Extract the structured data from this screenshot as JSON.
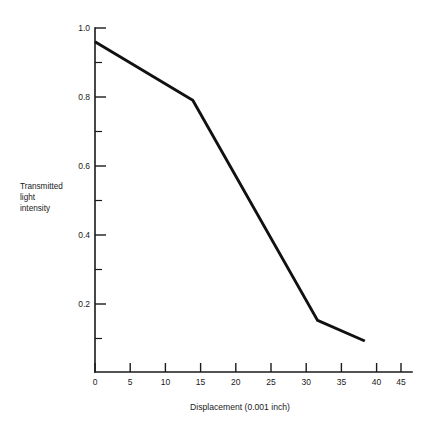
{
  "chart_data": {
    "type": "line",
    "title": "",
    "subtitle": "",
    "xlabel": "Displacement (0.001 inch)",
    "ylabel_lines": [
      "Transmitted",
      "light",
      "intensity"
    ],
    "ylabel": "Transmitted light intensity",
    "xlim": [
      0,
      47
    ],
    "ylim": [
      0,
      1.0
    ],
    "grid": false,
    "legend": false,
    "legend_position": "none",
    "line_color": "#111111",
    "axis_color": "#1a1a1a",
    "background_color": "#ffffff",
    "x_ticks_major": [
      0,
      5,
      10,
      15,
      20,
      25,
      30,
      35,
      40,
      45
    ],
    "x_tick_labels": [
      "0",
      "5",
      "10",
      "15",
      "20",
      "25",
      "30",
      "35",
      "40",
      "45"
    ],
    "y_ticks_major": [
      0.2,
      0.4,
      0.6,
      0.8,
      1.0
    ],
    "y_tick_labels": [
      "0.2",
      "0.4",
      "0.6",
      "0.8",
      "1.0"
    ],
    "y_ticks_minor": [
      0.1,
      0.3,
      0.5,
      0.7,
      0.9
    ],
    "markers": "none",
    "x": [
      0,
      14.5,
      33,
      40
    ],
    "y": [
      0.96,
      0.79,
      0.15,
      0.09
    ],
    "series": [
      {
        "name": "Transmitted light intensity",
        "points": [
          {
            "x": 0,
            "y": 0.96
          },
          {
            "x": 14.5,
            "y": 0.79
          },
          {
            "x": 33,
            "y": 0.15
          },
          {
            "x": 40,
            "y": 0.09
          }
        ]
      }
    ]
  }
}
